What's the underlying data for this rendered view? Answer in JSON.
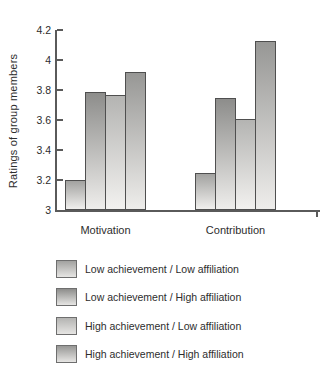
{
  "chart_data": {
    "type": "bar",
    "title": "",
    "ylabel": "Ratings of group members",
    "xlabel": "",
    "categories": [
      "Motivation",
      "Contribution"
    ],
    "series": [
      {
        "name": "Low achievement / Low affiliation",
        "values": [
          3.2,
          3.25
        ],
        "top_color": "#a2a2a0",
        "bottom_color": "#f0efed"
      },
      {
        "name": "Low achievement / High affiliation",
        "values": [
          3.79,
          3.75
        ],
        "top_color": "#8d8d8b",
        "bottom_color": "#eeedeb"
      },
      {
        "name": "High achievement / Low affiliation",
        "values": [
          3.77,
          3.61
        ],
        "top_color": "#b4b4b2",
        "bottom_color": "#f2f1ef"
      },
      {
        "name": "High achievement / High affiliation",
        "values": [
          3.92,
          4.13
        ],
        "top_color": "#979795",
        "bottom_color": "#eeedeb"
      }
    ],
    "ylim": [
      3,
      4.2
    ],
    "yticks": [
      3,
      3.2,
      3.4,
      3.6,
      3.8,
      4,
      4.2
    ],
    "grid": false,
    "legend_position": "bottom",
    "colors": {
      "axis": "#5a5a5a",
      "bar_border": "#4f4f4f",
      "text": "#2d2d2d",
      "legend_swatch_bottom": "#e6e5e3"
    }
  }
}
